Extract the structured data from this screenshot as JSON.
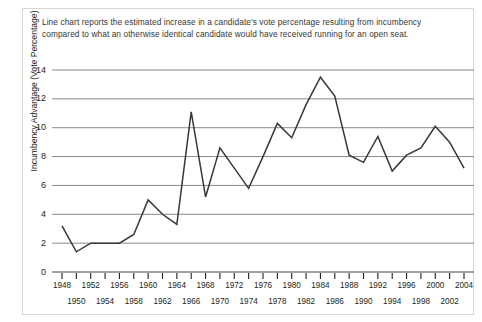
{
  "caption": {
    "text": "Line chart reports the estimated increase in a candidate's vote percentage resulting from incumbency compared to what an otherwise identical candidate would have received running for an open seat."
  },
  "chart_data": {
    "type": "line",
    "title": "",
    "xlabel": "",
    "ylabel": "Incumbency Advantage (Vote Percentage)",
    "ylim": [
      0,
      14
    ],
    "yticks": [
      0,
      2,
      4,
      6,
      8,
      10,
      12,
      14
    ],
    "ytick_labels": [
      "0",
      "2",
      "4",
      "6",
      "8",
      "10",
      "12",
      "14"
    ],
    "grid": true,
    "legend": "none",
    "line_color": "#3a3734",
    "x": [
      1948,
      1950,
      1952,
      1954,
      1956,
      1958,
      1960,
      1962,
      1964,
      1966,
      1968,
      1970,
      1972,
      1974,
      1976,
      1978,
      1980,
      1982,
      1984,
      1986,
      1988,
      1990,
      1992,
      1994,
      1996,
      1998,
      2000,
      2002,
      2004
    ],
    "xtick_labels": [
      "1948",
      "1950",
      "1952",
      "1954",
      "1956",
      "1958",
      "1960",
      "1962",
      "1964",
      "1966",
      "1968",
      "1970",
      "1972",
      "1974",
      "1976",
      "1978",
      "1980",
      "1982",
      "1984",
      "1986",
      "1988",
      "1990",
      "1992",
      "1994",
      "1996",
      "1998",
      "2000",
      "2002",
      "2004"
    ],
    "values": [
      3.2,
      1.4,
      2.0,
      2.0,
      2.0,
      2.6,
      5.0,
      4.0,
      3.3,
      11.1,
      5.2,
      8.6,
      7.2,
      5.8,
      8.0,
      10.3,
      9.3,
      11.6,
      13.5,
      12.2,
      8.1,
      7.6,
      9.4,
      7.0,
      8.1,
      8.6,
      10.1,
      9.0,
      7.2
    ]
  }
}
